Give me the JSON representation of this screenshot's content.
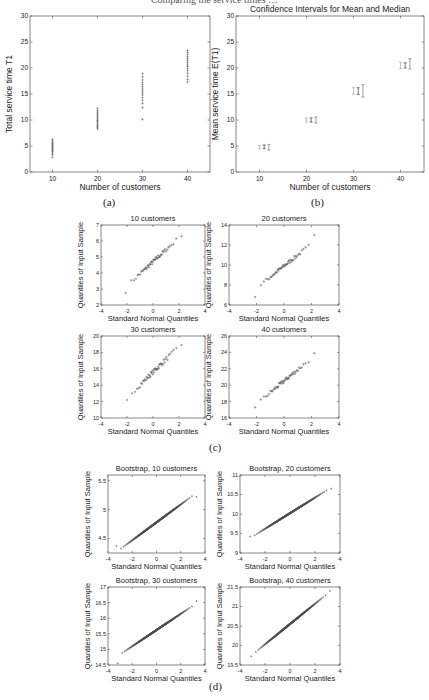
{
  "page": {
    "header_fragment": "Comparing the service times …",
    "captions": {
      "a": "(a)",
      "b": "(b)",
      "c": "(c)",
      "d": "(d)"
    }
  },
  "chart_data": [
    {
      "id": "a",
      "type": "scatter",
      "title": "",
      "xlabel": "Number of customers",
      "ylabel": "Total service time T1",
      "xlim": [
        5,
        45
      ],
      "ylim": [
        0,
        30
      ],
      "xticks": [
        10,
        20,
        30,
        40
      ],
      "yticks": [
        0,
        5,
        10,
        15,
        20,
        25,
        30
      ],
      "series": [
        {
          "name": "10",
          "x": 10,
          "values": [
            2.8,
            3.3,
            3.6,
            3.9,
            4.1,
            4.3,
            4.5,
            4.7,
            4.9,
            5.1,
            5.3,
            5.5,
            5.7,
            6.0,
            6.3
          ]
        },
        {
          "name": "20",
          "x": 20,
          "values": [
            8.3,
            8.6,
            8.8,
            9.0,
            9.3,
            9.6,
            9.8,
            10.0,
            10.3,
            10.6,
            10.9,
            11.2,
            11.5,
            11.8,
            12.2
          ]
        },
        {
          "name": "30",
          "x": 30,
          "values": [
            10.1,
            12.4,
            13.2,
            13.8,
            14.3,
            14.8,
            15.2,
            15.6,
            16.0,
            16.4,
            16.8,
            17.2,
            17.7,
            18.3,
            18.9
          ]
        },
        {
          "name": "40",
          "x": 40,
          "values": [
            17.3,
            17.8,
            18.4,
            19.0,
            19.5,
            19.9,
            20.3,
            20.6,
            21.0,
            21.4,
            21.8,
            22.2,
            22.6,
            23.0,
            23.4
          ]
        }
      ],
      "grid": false
    },
    {
      "id": "b",
      "type": "errorbar",
      "title": "Confidence Intervals for Mean and Median",
      "xlabel": "Number of customers",
      "ylabel": "Mean service time E(T1)",
      "xlim": [
        5,
        45
      ],
      "ylim": [
        0,
        30
      ],
      "xticks": [
        10,
        20,
        30,
        40
      ],
      "yticks": [
        0,
        5,
        10,
        15,
        20,
        25,
        30
      ],
      "series": [
        {
          "name": "CI 1",
          "x": [
            10,
            20,
            30,
            40
          ],
          "low": [
            4.4,
            9.6,
            15.0,
            19.9
          ],
          "high": [
            5.1,
            10.4,
            16.3,
            21.1
          ]
        },
        {
          "name": "CI 2 (mean)",
          "x": [
            11,
            21,
            31,
            41
          ],
          "low": [
            4.5,
            9.6,
            14.9,
            20.0
          ],
          "high": [
            5.2,
            10.4,
            16.2,
            21.0
          ]
        },
        {
          "name": "CI 3 (median)",
          "x": [
            12,
            22,
            32,
            42
          ],
          "low": [
            4.2,
            9.4,
            14.4,
            19.8
          ],
          "high": [
            5.3,
            10.6,
            16.8,
            21.8
          ]
        }
      ],
      "grid": false
    },
    {
      "id": "c1",
      "type": "scatter",
      "title": "10 customers",
      "xlabel": "Standard Normal Quantiles",
      "ylabel": "Quantiles of Input Sample",
      "xlim": [
        -4,
        4
      ],
      "ylim": [
        2,
        7
      ],
      "xticks": [
        -4,
        -2,
        0,
        2,
        4
      ],
      "yticks": [
        2,
        3,
        4,
        5,
        6,
        7
      ],
      "qq": {
        "center": 4.7,
        "slope": 0.75,
        "xmin": -2.1,
        "xmax": 2.2,
        "n": 50,
        "low_tail": 2.75,
        "high_tail": 6.3
      }
    },
    {
      "id": "c2",
      "type": "scatter",
      "title": "20 customers",
      "xlabel": "Standard Normal Quantiles",
      "ylabel": "Quantiles of Input Sample",
      "xlim": [
        -4,
        4
      ],
      "ylim": [
        6,
        14
      ],
      "xticks": [
        -4,
        -2,
        0,
        2,
        4
      ],
      "yticks": [
        6,
        8,
        10,
        12,
        14
      ],
      "qq": {
        "center": 9.9,
        "slope": 1.1,
        "xmin": -2.1,
        "xmax": 2.2,
        "n": 50,
        "low_tail": 6.8,
        "high_tail": 13.0
      }
    },
    {
      "id": "c3",
      "type": "scatter",
      "title": "30 customers",
      "xlabel": "Standard Normal Quantiles",
      "ylabel": "Quantiles of Input Sample",
      "xlim": [
        -4,
        4
      ],
      "ylim": [
        10,
        20
      ],
      "xticks": [
        -4,
        -2,
        0,
        2,
        4
      ],
      "yticks": [
        10,
        12,
        14,
        16,
        18,
        20
      ],
      "qq": {
        "center": 15.6,
        "slope": 1.55,
        "xmin": -2.0,
        "xmax": 2.2,
        "n": 50,
        "low_tail": 12.2,
        "high_tail": 18.9
      }
    },
    {
      "id": "c4",
      "type": "scatter",
      "title": "40 customers",
      "xlabel": "Standard Normal Quantiles",
      "ylabel": "Quantiles of Input Sample",
      "xlim": [
        -4,
        4
      ],
      "ylim": [
        16,
        26
      ],
      "xticks": [
        -4,
        -2,
        0,
        2,
        4
      ],
      "yticks": [
        16,
        18,
        20,
        22,
        24,
        26
      ],
      "qq": {
        "center": 20.5,
        "slope": 1.4,
        "xmin": -2.1,
        "xmax": 2.2,
        "n": 50,
        "low_tail": 17.3,
        "high_tail": 23.9
      }
    },
    {
      "id": "d1",
      "type": "scatter",
      "title": "Bootstrap, 10 customers",
      "xlabel": "Standard Normal Quantiles",
      "ylabel": "Quantiles of Input Sample",
      "xlim": [
        -4,
        4
      ],
      "ylim": [
        4.25,
        5.6
      ],
      "xticks": [
        -4,
        -2,
        0,
        2,
        4
      ],
      "yticks": [
        4.5,
        5,
        5.5
      ],
      "qq": {
        "center": 4.78,
        "slope": 0.155,
        "xmin": -3.3,
        "xmax": 3.3,
        "n": 400,
        "low_tail": 4.37,
        "high_tail": 5.22
      }
    },
    {
      "id": "d2",
      "type": "scatter",
      "title": "Bootstrap, 20 customers",
      "xlabel": "Standard Normal Quantiles",
      "ylabel": "Quantiles of Input Sample",
      "xlim": [
        -4,
        4
      ],
      "ylim": [
        9,
        11
      ],
      "xticks": [
        -4,
        -2,
        0,
        2,
        4
      ],
      "yticks": [
        9,
        9.5,
        10,
        10.5,
        11
      ],
      "qq": {
        "center": 10.02,
        "slope": 0.2,
        "xmin": -3.2,
        "xmax": 3.3,
        "n": 400,
        "low_tail": 9.42,
        "high_tail": 10.65
      }
    },
    {
      "id": "d3",
      "type": "scatter",
      "title": "Bootstrap, 30 customers",
      "xlabel": "Standard Normal Quantiles",
      "ylabel": "Quantiles of Input Sample",
      "xlim": [
        -4,
        4
      ],
      "ylim": [
        14.5,
        17
      ],
      "xticks": [
        -4,
        -2,
        0,
        2,
        4
      ],
      "yticks": [
        14.5,
        15,
        15.5,
        16,
        16.5,
        17
      ],
      "qq": {
        "center": 15.62,
        "slope": 0.26,
        "xmin": -3.2,
        "xmax": 3.3,
        "n": 400,
        "low_tail": 14.55,
        "high_tail": 16.55
      }
    },
    {
      "id": "d4",
      "type": "scatter",
      "title": "Bootstrap, 40 customers",
      "xlabel": "Standard Normal Quantiles",
      "ylabel": "Quantiles of Input Sample",
      "xlim": [
        -4,
        4
      ],
      "ylim": [
        19.5,
        21.5
      ],
      "xticks": [
        -4,
        -2,
        0,
        2,
        4
      ],
      "yticks": [
        19.5,
        20,
        20.5,
        21,
        21.5
      ],
      "qq": {
        "center": 20.55,
        "slope": 0.26,
        "xmin": -3.1,
        "xmax": 3.2,
        "n": 400,
        "low_tail": 19.72,
        "high_tail": 21.4
      }
    }
  ],
  "layout": {
    "plots": {
      "a": {
        "x": 30,
        "y": 16,
        "w": 180,
        "h": 156
      },
      "b": {
        "x": 236,
        "y": 16,
        "w": 188,
        "h": 156
      },
      "c1": {
        "x": 101,
        "y": 225,
        "w": 104,
        "h": 80
      },
      "c2": {
        "x": 229,
        "y": 225,
        "w": 110,
        "h": 80
      },
      "c3": {
        "x": 101,
        "y": 336,
        "w": 104,
        "h": 82
      },
      "c4": {
        "x": 229,
        "y": 336,
        "w": 110,
        "h": 82
      },
      "d1": {
        "x": 108,
        "y": 475,
        "w": 97,
        "h": 78
      },
      "d2": {
        "x": 240,
        "y": 475,
        "w": 100,
        "h": 78
      },
      "d3": {
        "x": 108,
        "y": 587,
        "w": 97,
        "h": 78
      },
      "d4": {
        "x": 240,
        "y": 587,
        "w": 100,
        "h": 78
      }
    },
    "colors": {
      "axis": "#555555",
      "marker": "#555555",
      "text": "#222222"
    }
  }
}
